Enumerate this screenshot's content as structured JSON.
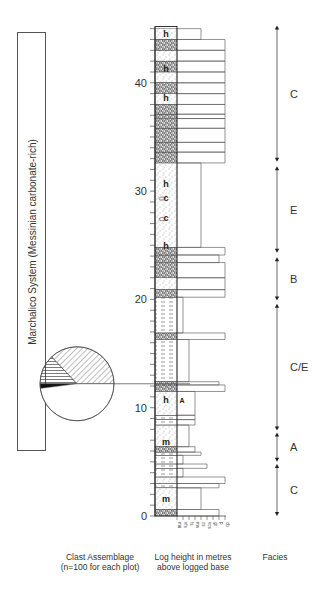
{
  "title_box": {
    "text": "Marchalico System (Messinian carbonate-rich)"
  },
  "captions": {
    "clast_line1": "Clast Assemblage",
    "clast_line2": "(n=100 for each plot)",
    "log_line1": "Log height in metres",
    "log_line2": "above logged base",
    "facies": "Facies"
  },
  "axis": {
    "ticks_major": [
      0,
      10,
      20,
      30,
      40
    ],
    "minor_step": 1,
    "max": 45
  },
  "grain_size_labels": [
    "mu",
    "vfs",
    "fs",
    "ms",
    "cs",
    "vcs",
    "gr",
    "p",
    "cb"
  ],
  "lithology_symbols": [
    {
      "h": 44.5,
      "label": "h"
    },
    {
      "h": 41.3,
      "label": "h"
    },
    {
      "h": 38.6,
      "label": "h"
    },
    {
      "h": 30.7,
      "label": "h"
    },
    {
      "h": 29.4,
      "label": "c"
    },
    {
      "h": 27.5,
      "label": "c"
    },
    {
      "h": 24.9,
      "label": "h"
    },
    {
      "h": 10.7,
      "label": "h"
    },
    {
      "h": 10.7,
      "label": "A"
    },
    {
      "h": 6.8,
      "label": "m"
    },
    {
      "h": 1.6,
      "label": "m"
    }
  ],
  "facies": [
    {
      "label": "C",
      "from": 32.7,
      "to": 45.3
    },
    {
      "label": "E",
      "from": 24.3,
      "to": 32.3
    },
    {
      "label": "B",
      "from": 19.9,
      "to": 23.9
    },
    {
      "label": "C/E",
      "from": 7.9,
      "to": 19.6
    },
    {
      "label": "A",
      "from": 5.0,
      "to": 7.7
    },
    {
      "label": "C",
      "from": 0.0,
      "to": 4.8
    }
  ],
  "pie": {
    "anchor_height": 12.3,
    "n": 100,
    "label": "1",
    "slices": [
      {
        "name": "diagonal-hatched",
        "value": 37
      },
      {
        "name": "horizontal-hatched",
        "value": 13
      },
      {
        "name": "solid-black",
        "value": 2
      },
      {
        "name": "white",
        "value": 48
      }
    ]
  },
  "chart_data": {
    "type": "table",
    "ylabel": "Log height in metres above logged base",
    "ylim": [
      0,
      45
    ],
    "yticks": [
      0,
      10,
      20,
      30,
      40
    ],
    "facies_intervals": [
      {
        "facies": "C",
        "bottom_m": 0.0,
        "top_m": 4.8
      },
      {
        "facies": "A",
        "bottom_m": 5.0,
        "top_m": 7.7
      },
      {
        "facies": "C/E",
        "bottom_m": 7.9,
        "top_m": 19.6
      },
      {
        "facies": "B",
        "bottom_m": 19.9,
        "top_m": 23.9
      },
      {
        "facies": "E",
        "bottom_m": 24.3,
        "top_m": 32.3
      },
      {
        "facies": "C",
        "bottom_m": 32.7,
        "top_m": 45.3
      }
    ],
    "grain_size_scale": [
      "mu",
      "vfs",
      "fs",
      "ms",
      "cs",
      "vcs",
      "gr",
      "p",
      "cb"
    ],
    "clast_assemblage_pie": {
      "height_m": 12.3,
      "n": 100,
      "slices": [
        {
          "category": "diagonal-hatched",
          "percent": 37
        },
        {
          "category": "horizontal-hatched",
          "percent": 13
        },
        {
          "category": "black",
          "percent": 2
        },
        {
          "category": "white",
          "percent": 48
        }
      ]
    }
  }
}
